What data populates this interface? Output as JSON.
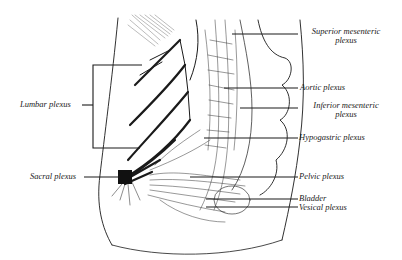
{
  "labels": {
    "superior_mesenteric": {
      "line1": "Superior mesenteric",
      "line2": "plexus"
    },
    "aortic": "Aortic plexus",
    "inferior_mesenteric": {
      "line1": "Inferior mesenteric",
      "line2": "plexus"
    },
    "hypogastric": "Hypogastric plexus",
    "pelvic": "Pelvic plexus",
    "bladder": "Bladder",
    "vesical": "Vesical plexus",
    "lumbar": "Lumbar plexus",
    "sacral": "Sacral plexus"
  },
  "vertebra_marks": [
    "LI",
    "LII",
    "LIII",
    "LIV",
    "LV",
    "SI",
    "SII",
    "SIII",
    "Cox"
  ],
  "colors": {
    "ink": "#1a1a1a",
    "background": "#ffffff"
  }
}
